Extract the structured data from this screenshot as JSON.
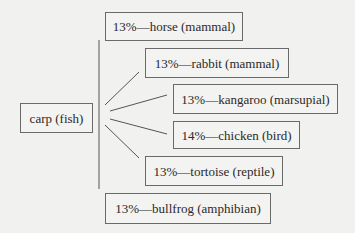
{
  "diagram": {
    "source": {
      "label": "carp (fish)"
    },
    "colors": {
      "background": "#f1f1ef",
      "line": "#555555",
      "border": "#6a6a6a",
      "text": "#2a2a2a"
    },
    "targets": [
      {
        "label": "13%—horse (mammal)",
        "percent": "13%",
        "animal": "horse",
        "class": "mammal"
      },
      {
        "label": "13%—rabbit (mammal)",
        "percent": "13%",
        "animal": "rabbit",
        "class": "mammal"
      },
      {
        "label": "13%—kangaroo (marsupial)",
        "percent": "13%",
        "animal": "kangaroo",
        "class": "marsupial"
      },
      {
        "label": "14%—chicken (bird)",
        "percent": "14%",
        "animal": "chicken",
        "class": "bird"
      },
      {
        "label": "13%—tortoise (reptile)",
        "percent": "13%",
        "animal": "tortoise",
        "class": "reptile"
      },
      {
        "label": "13%—bullfrog (amphibian)",
        "percent": "13%",
        "animal": "bullfrog",
        "class": "amphibian"
      }
    ]
  }
}
